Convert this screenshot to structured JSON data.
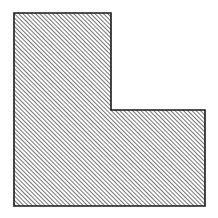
{
  "figure": {
    "canvas": {
      "width": 218,
      "height": 218,
      "background_color": "#ffffff"
    },
    "shape": {
      "name": "l-shape-polygon",
      "kind": "polygon",
      "vertex_count": 6,
      "vertices": [
        {
          "label": "top-left",
          "x": 14,
          "y": 13
        },
        {
          "label": "top-right",
          "x": 111,
          "y": 13
        },
        {
          "label": "inner-corner-right",
          "x": 111,
          "y": 110
        },
        {
          "label": "mid-right",
          "x": 205,
          "y": 110
        },
        {
          "label": "bottom-right",
          "x": 205,
          "y": 206
        },
        {
          "label": "bottom-left",
          "x": 14,
          "y": 206
        }
      ],
      "points_attr": "14,13 111,13 111,110 205,110 205,206 14,206",
      "outline_color": "#1a1a1a",
      "outline_width": 1.6,
      "fill": "hatch"
    },
    "hatch": {
      "name": "diagonal-hatch-pattern",
      "direction": "forward-slash",
      "angle_degrees": 45,
      "spacing_px": 3,
      "line_width_px": 1.3,
      "line_color": "#2b2b2b",
      "background_color": "#ffffff"
    },
    "dimensions": {
      "overall_width_px": 191,
      "overall_height_px": 193,
      "upper_arm_width_px": 97,
      "upper_arm_height_px": 97,
      "lower_arm_width_px": 191,
      "lower_arm_height_px": 96
    }
  }
}
